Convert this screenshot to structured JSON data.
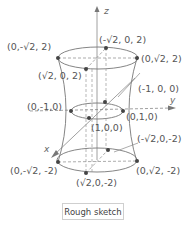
{
  "diagram": {
    "caption": "Rough sketch",
    "axes": {
      "x": "x",
      "y": "y",
      "z": "z"
    },
    "points": {
      "top_neg_y": "(0,-√2, 2)",
      "top_neg_x": "(-√2, 0, 2)",
      "top_pos_y": "(0,√2, 2)",
      "top_pos_x": "(√2, 0, 2)",
      "mid_neg_y": "(0,-1,0)",
      "mid_neg_x": "(-1, 0, 0)",
      "mid_pos_y": "(0,1,0)",
      "mid_pos_x": "(1,0,0)",
      "bot_neg_x": "(-√2,0,-2)",
      "bot_neg_y": "(0,-√2, -2)",
      "bot_pos_y": "(0,√2, -2)",
      "bot_pos_x": "(√2,0,-2)"
    },
    "colors": {
      "line": "#777777",
      "point": "#444444",
      "text": "#555555"
    }
  }
}
